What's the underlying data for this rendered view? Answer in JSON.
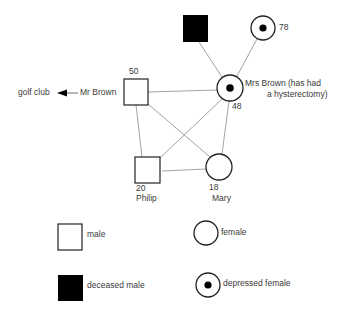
{
  "diagram": {
    "type": "genogram",
    "nodes": [
      {
        "id": "deceased-male",
        "shape": "square",
        "filled": true,
        "label": ""
      },
      {
        "id": "grandmother",
        "shape": "circle-dot",
        "age": "78"
      },
      {
        "id": "mrs-brown",
        "shape": "circle-dot",
        "age": "48",
        "name_line1": "Mrs Brown (has had",
        "name_line2": "a hysterectomy)"
      },
      {
        "id": "mr-brown",
        "shape": "square",
        "age": "50",
        "name": "Mr Brown"
      },
      {
        "id": "philip",
        "shape": "square",
        "age": "20",
        "name": "Philip"
      },
      {
        "id": "mary",
        "shape": "circle",
        "age": "18",
        "name": "Mary"
      }
    ],
    "external": {
      "label": "golf club",
      "arrow_from": "Mr Brown"
    },
    "edges": [
      [
        "deceased-male",
        "mrs-brown"
      ],
      [
        "grandmother",
        "mrs-brown"
      ],
      [
        "mr-brown",
        "mrs-brown"
      ],
      [
        "mr-brown",
        "philip"
      ],
      [
        "mr-brown",
        "mary"
      ],
      [
        "mrs-brown",
        "philip"
      ],
      [
        "mrs-brown",
        "mary"
      ],
      [
        "philip",
        "mary"
      ]
    ]
  },
  "legend": {
    "male": "male",
    "female": "female",
    "deceased_male": "deceased male",
    "depressed_female": "depressed female"
  },
  "colors": {
    "line": "#7a7a7a",
    "stroke": "#222222",
    "fill": "#000000"
  }
}
